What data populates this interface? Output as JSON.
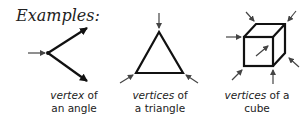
{
  "title": "Examples:",
  "figures": [
    {
      "name": "angle",
      "caption_term": "vertex",
      "caption_rest1": " of",
      "caption_line2": "an angle"
    },
    {
      "name": "triangle",
      "caption_term": "vertices",
      "caption_rest1": " of",
      "caption_line2": "a triangle"
    },
    {
      "name": "cube",
      "caption_term": "vertices",
      "caption_rest1": " of a cube",
      "caption_line2": ""
    }
  ],
  "colors": {
    "line": "#111111",
    "pointer": "#444444"
  }
}
